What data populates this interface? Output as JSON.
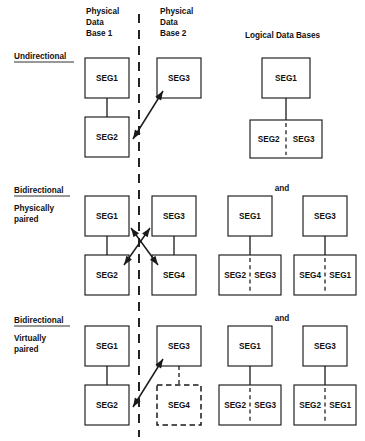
{
  "figure": {
    "title_absent": true,
    "column_headers": [
      {
        "name": "physical-db-1",
        "lines": [
          "Physical",
          "Data",
          "Base 1"
        ],
        "x": 86,
        "y": 14
      },
      {
        "name": "physical-db-2",
        "lines": [
          "Physical",
          "Data",
          "Base 2"
        ],
        "x": 160,
        "y": 14
      },
      {
        "name": "logical-dbs",
        "lines": [
          "Logical  Data  Bases"
        ],
        "x": 245,
        "y": 38
      }
    ],
    "divider": {
      "name": "physical-db-separator",
      "x": 139,
      "y1": 14,
      "y2": 437
    },
    "rows": [
      {
        "id": "undirectional",
        "title": "Undirectional",
        "subtitle_lines": [],
        "title_x": 14,
        "title_y": 59,
        "title_underline": {
          "x1": 14,
          "x2": 74,
          "y": 62
        },
        "boxes": [
          {
            "name": "phys1-seg1",
            "label": "SEG1",
            "x": 85,
            "y": 58,
            "w": 44,
            "h": 40,
            "style": "solid"
          },
          {
            "name": "phys1-seg2",
            "label": "SEG2",
            "x": 85,
            "y": 117,
            "w": 44,
            "h": 40,
            "style": "solid"
          },
          {
            "name": "phys2-seg3",
            "label": "SEG3",
            "x": 157,
            "y": 58,
            "w": 44,
            "h": 40,
            "style": "solid"
          },
          {
            "name": "logical-seg1",
            "label": "SEG1",
            "x": 262,
            "y": 58,
            "w": 48,
            "h": 40,
            "style": "solid"
          },
          {
            "name": "logical-seg2-seg3",
            "label": "SEG2 | SEG3",
            "left": "SEG2",
            "right": "SEG3",
            "x": 250,
            "y": 120,
            "w": 72,
            "h": 38,
            "style": "solid",
            "split": true
          }
        ],
        "links": [
          {
            "name": "link-seg1-seg2",
            "x1": 107,
            "y1": 98,
            "x2": 107,
            "y2": 117,
            "style": "solid"
          },
          {
            "name": "link-logical-seg1-pair",
            "x1": 286,
            "y1": 98,
            "x2": 286,
            "y2": 120,
            "style": "solid"
          }
        ],
        "arrows": [
          {
            "name": "arrow-seg2-seg3",
            "x1": 133,
            "y1": 139,
            "x2": 163,
            "y2": 91,
            "double": true
          }
        ]
      },
      {
        "id": "bidirectional-physically-paired",
        "title": "Bidirectional",
        "subtitle_lines": [
          "Physically",
          "paired"
        ],
        "title_x": 14,
        "title_y": 193,
        "title_underline": {
          "x1": 14,
          "x2": 70,
          "y": 196
        },
        "subtitle_x": 14,
        "subtitle_y": 211,
        "and_label": {
          "name": "and-connector",
          "text": "and",
          "x": 282,
          "y": 191
        },
        "boxes": [
          {
            "name": "phys1-seg1",
            "label": "SEG1",
            "x": 85,
            "y": 196,
            "w": 44,
            "h": 40,
            "style": "solid"
          },
          {
            "name": "phys1-seg2",
            "label": "SEG2",
            "x": 85,
            "y": 255,
            "w": 44,
            "h": 40,
            "style": "solid"
          },
          {
            "name": "phys2-seg3",
            "label": "SEG3",
            "x": 152,
            "y": 196,
            "w": 44,
            "h": 40,
            "style": "solid"
          },
          {
            "name": "phys2-seg4",
            "label": "SEG4",
            "x": 152,
            "y": 255,
            "w": 44,
            "h": 40,
            "style": "solid"
          },
          {
            "name": "logical-a-seg1",
            "label": "SEG1",
            "x": 228,
            "y": 196,
            "w": 44,
            "h": 40,
            "style": "solid"
          },
          {
            "name": "logical-a-pair",
            "label": "SEG2 | SEG3",
            "left": "SEG2",
            "right": "SEG3",
            "x": 219,
            "y": 255,
            "w": 62,
            "h": 40,
            "style": "solid",
            "split": true
          },
          {
            "name": "logical-b-seg3",
            "label": "SEG3",
            "x": 303,
            "y": 196,
            "w": 44,
            "h": 40,
            "style": "solid"
          },
          {
            "name": "logical-b-pair",
            "label": "SEG4 | SEG1",
            "left": "SEG4",
            "right": "SEG1",
            "x": 294,
            "y": 255,
            "w": 62,
            "h": 40,
            "style": "solid",
            "split": true
          }
        ],
        "links": [
          {
            "name": "link-seg1-seg2",
            "x1": 107,
            "y1": 236,
            "x2": 107,
            "y2": 255,
            "style": "solid"
          },
          {
            "name": "link-seg3-seg4",
            "x1": 174,
            "y1": 236,
            "x2": 174,
            "y2": 255,
            "style": "solid"
          },
          {
            "name": "link-logical-a",
            "x1": 250,
            "y1": 236,
            "x2": 250,
            "y2": 255,
            "style": "solid"
          },
          {
            "name": "link-logical-b",
            "x1": 325,
            "y1": 236,
            "x2": 325,
            "y2": 255,
            "style": "solid"
          }
        ],
        "arrows": [
          {
            "name": "arrow-seg1-seg4",
            "x1": 131,
            "y1": 228,
            "x2": 158,
            "y2": 265,
            "double": true
          },
          {
            "name": "arrow-seg3-seg2",
            "x1": 150,
            "y1": 228,
            "x2": 124,
            "y2": 265,
            "double": true
          }
        ]
      },
      {
        "id": "bidirectional-virtually-paired",
        "title": "Bidirectional",
        "subtitle_lines": [
          "Virtually",
          "paired"
        ],
        "title_x": 14,
        "title_y": 323,
        "title_underline": {
          "x1": 14,
          "x2": 70,
          "y": 326
        },
        "subtitle_x": 14,
        "subtitle_y": 341,
        "and_label": {
          "name": "and-connector",
          "text": "and",
          "x": 282,
          "y": 321
        },
        "boxes": [
          {
            "name": "phys1-seg1",
            "label": "SEG1",
            "x": 85,
            "y": 326,
            "w": 44,
            "h": 40,
            "style": "solid"
          },
          {
            "name": "phys1-seg2",
            "label": "SEG2",
            "x": 85,
            "y": 385,
            "w": 44,
            "h": 40,
            "style": "solid"
          },
          {
            "name": "phys2-seg3",
            "label": "SEG3",
            "x": 157,
            "y": 326,
            "w": 44,
            "h": 40,
            "style": "solid"
          },
          {
            "name": "phys2-seg4-virtual",
            "label": "SEG4",
            "x": 157,
            "y": 385,
            "w": 44,
            "h": 40,
            "style": "dashed"
          },
          {
            "name": "logical-a-seg1",
            "label": "SEG1",
            "x": 228,
            "y": 326,
            "w": 44,
            "h": 40,
            "style": "solid"
          },
          {
            "name": "logical-a-pair",
            "label": "SEG2 | SEG3",
            "left": "SEG2",
            "right": "SEG3",
            "x": 219,
            "y": 385,
            "w": 62,
            "h": 40,
            "style": "solid",
            "split": true
          },
          {
            "name": "logical-b-seg3",
            "label": "SEG3",
            "x": 303,
            "y": 326,
            "w": 44,
            "h": 40,
            "style": "solid"
          },
          {
            "name": "logical-b-pair",
            "label": "SEG2 | SEG1",
            "left": "SEG2",
            "right": "SEG1",
            "x": 294,
            "y": 385,
            "w": 62,
            "h": 40,
            "style": "solid",
            "split": true
          }
        ],
        "links": [
          {
            "name": "link-seg1-seg2",
            "x1": 107,
            "y1": 366,
            "x2": 107,
            "y2": 385,
            "style": "solid"
          },
          {
            "name": "link-seg3-seg4-virtual",
            "x1": 179,
            "y1": 366,
            "x2": 179,
            "y2": 385,
            "style": "dashed"
          },
          {
            "name": "link-logical-a",
            "x1": 250,
            "y1": 366,
            "x2": 250,
            "y2": 385,
            "style": "solid"
          },
          {
            "name": "link-logical-b",
            "x1": 325,
            "y1": 366,
            "x2": 325,
            "y2": 385,
            "style": "solid"
          }
        ],
        "arrows": [
          {
            "name": "arrow-seg2-seg3",
            "x1": 133,
            "y1": 407,
            "x2": 163,
            "y2": 359,
            "double": true
          }
        ]
      }
    ],
    "colors": {
      "background": "#ffffff",
      "ink": "#1a1a1a",
      "text": "#111111"
    }
  }
}
